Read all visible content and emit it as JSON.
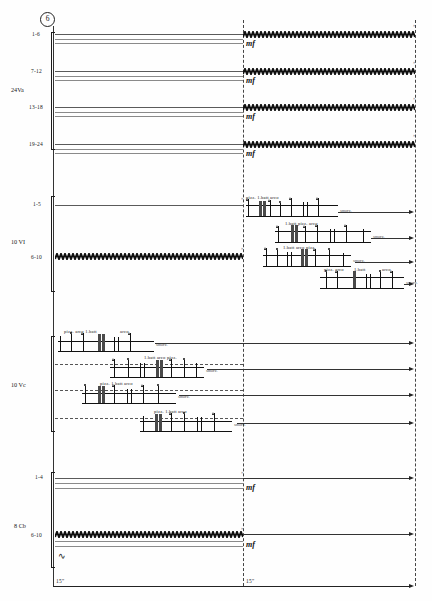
{
  "score": {
    "rehearsal_mark": "6",
    "duration_left": "15\"",
    "duration_right": "15\"",
    "dynamic": "mf",
    "smorzando": "smorz.",
    "systems": [
      {
        "instrument": "24Va",
        "staff_labels": [
          "1-6",
          "7-12",
          "13-18",
          "19-24"
        ],
        "type": "trill",
        "dynamics": [
          "mf",
          "mf",
          "mf",
          "mf"
        ]
      },
      {
        "instrument": "10 VI",
        "staff_labels": [
          "1-5",
          "6-10"
        ],
        "type": "mixed",
        "dynamics": []
      },
      {
        "instrument": "10 Vc",
        "staff_labels": [],
        "type": "clusters",
        "dynamics": []
      },
      {
        "instrument": "8 Cb",
        "staff_labels": [
          "1-4",
          "6-10"
        ],
        "type": "trill",
        "dynamics": [
          "mf",
          "mf"
        ]
      }
    ],
    "articulations": [
      {
        "id": "a1",
        "text": "pizz. 1.batt arco"
      },
      {
        "id": "a2",
        "text": "1.batt pizz.  arco"
      },
      {
        "id": "a3",
        "text": "1.batt arco pizz."
      },
      {
        "id": "a4",
        "text": "pizz. arco"
      },
      {
        "id": "a5",
        "text": "1.batt"
      },
      {
        "id": "a6",
        "text": "arco"
      },
      {
        "id": "a7",
        "text": "pizz.  arco  1.batt"
      },
      {
        "id": "a8",
        "text": "arco"
      },
      {
        "id": "a9",
        "text": "1.batt arco pizz."
      },
      {
        "id": "a10",
        "text": "pizz. 1.batt arco"
      }
    ],
    "smorz_labels": [
      "smorz.",
      "smorz.",
      "smorz.",
      "smorz.",
      "smorz.",
      "smorz.",
      "smorz.",
      "smorz."
    ]
  }
}
